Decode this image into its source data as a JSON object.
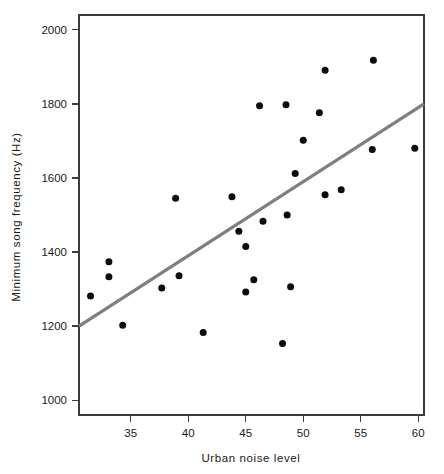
{
  "chart_data": {
    "type": "scatter",
    "title": "",
    "xlabel": "Urban noise level",
    "ylabel": "Minimum song frequency (Hz)",
    "xlim": [
      30.5,
      60.5
    ],
    "ylim": [
      960,
      2040
    ],
    "xticks": [
      35,
      40,
      45,
      50,
      55,
      60
    ],
    "yticks": [
      1000,
      1200,
      1400,
      1600,
      1800,
      2000
    ],
    "xtick_labels": [
      "35",
      "40",
      "45",
      "50",
      "55",
      "60"
    ],
    "ytick_labels": [
      "1000",
      "1200",
      "1400",
      "1600",
      "1800",
      "2000"
    ],
    "grid": false,
    "legend": false,
    "marker": "filled-circle",
    "marker_color": "#0d0d0d",
    "marker_size": 7,
    "points": [
      {
        "x": 31.5,
        "y": 1281
      },
      {
        "x": 33.1,
        "y": 1374
      },
      {
        "x": 33.1,
        "y": 1333
      },
      {
        "x": 34.3,
        "y": 1202
      },
      {
        "x": 37.7,
        "y": 1303
      },
      {
        "x": 38.9,
        "y": 1545
      },
      {
        "x": 39.2,
        "y": 1336
      },
      {
        "x": 41.3,
        "y": 1183
      },
      {
        "x": 43.8,
        "y": 1549
      },
      {
        "x": 44.4,
        "y": 1456
      },
      {
        "x": 45.0,
        "y": 1415
      },
      {
        "x": 45.0,
        "y": 1292
      },
      {
        "x": 45.7,
        "y": 1325
      },
      {
        "x": 46.2,
        "y": 1795
      },
      {
        "x": 46.5,
        "y": 1483
      },
      {
        "x": 48.2,
        "y": 1153
      },
      {
        "x": 48.5,
        "y": 1798
      },
      {
        "x": 48.6,
        "y": 1500
      },
      {
        "x": 48.9,
        "y": 1306
      },
      {
        "x": 49.3,
        "y": 1612
      },
      {
        "x": 50.0,
        "y": 1702
      },
      {
        "x": 51.4,
        "y": 1776
      },
      {
        "x": 51.9,
        "y": 1891
      },
      {
        "x": 51.9,
        "y": 1555
      },
      {
        "x": 53.3,
        "y": 1568
      },
      {
        "x": 56.0,
        "y": 1677
      },
      {
        "x": 56.1,
        "y": 1918
      },
      {
        "x": 59.7,
        "y": 1680
      }
    ],
    "trend_line": {
      "color": "#7f7f7f",
      "width": 3.2,
      "x_start": 30.5,
      "y_start": 1200,
      "x_end": 60.5,
      "y_end": 1800
    }
  }
}
